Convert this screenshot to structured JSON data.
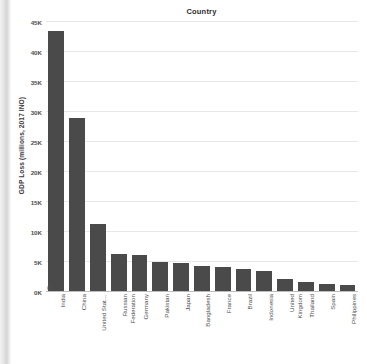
{
  "chart_data": {
    "type": "bar",
    "title": "Country",
    "xlabel": "",
    "ylabel": "GDP Loss (millions, 2017 INO)",
    "ylim": [
      0,
      45000
    ],
    "grid": true,
    "legend": null,
    "orientation": "vertical",
    "bar_color": "#4a4a4a",
    "y_ticks": [
      0,
      5000,
      10000,
      15000,
      20000,
      25000,
      30000,
      35000,
      40000,
      45000
    ],
    "y_tick_labels": [
      "0K",
      "5K",
      "10K",
      "15K",
      "20K",
      "25K",
      "30K",
      "35K",
      "40K",
      "45K"
    ],
    "zero_marker": "0",
    "categories": [
      "India",
      "China",
      "United Stat…",
      "Russian Federation",
      "Germany",
      "Pakistan",
      "Japan",
      "Bangladesh",
      "France",
      "Brazil",
      "Indonesia",
      "United Kingdom",
      "Thailand",
      "Spain",
      "Philippines"
    ],
    "category_lines": [
      [
        "India",
        ""
      ],
      [
        "China",
        ""
      ],
      [
        "United Stat…",
        ""
      ],
      [
        "Russian",
        "Federation"
      ],
      [
        "Germany",
        ""
      ],
      [
        "Pakistan",
        ""
      ],
      [
        "Japan",
        ""
      ],
      [
        "Bangladesh",
        ""
      ],
      [
        "France",
        ""
      ],
      [
        "Brazil",
        ""
      ],
      [
        "Indonesia",
        ""
      ],
      [
        "United",
        "Kingdom"
      ],
      [
        "Thailand",
        ""
      ],
      [
        "Spain",
        ""
      ],
      [
        "Philippines",
        ""
      ]
    ],
    "values": [
      43500,
      29000,
      11300,
      6300,
      6200,
      5000,
      4800,
      4400,
      4200,
      3900,
      3500,
      2200,
      1700,
      1300,
      1200
    ]
  }
}
